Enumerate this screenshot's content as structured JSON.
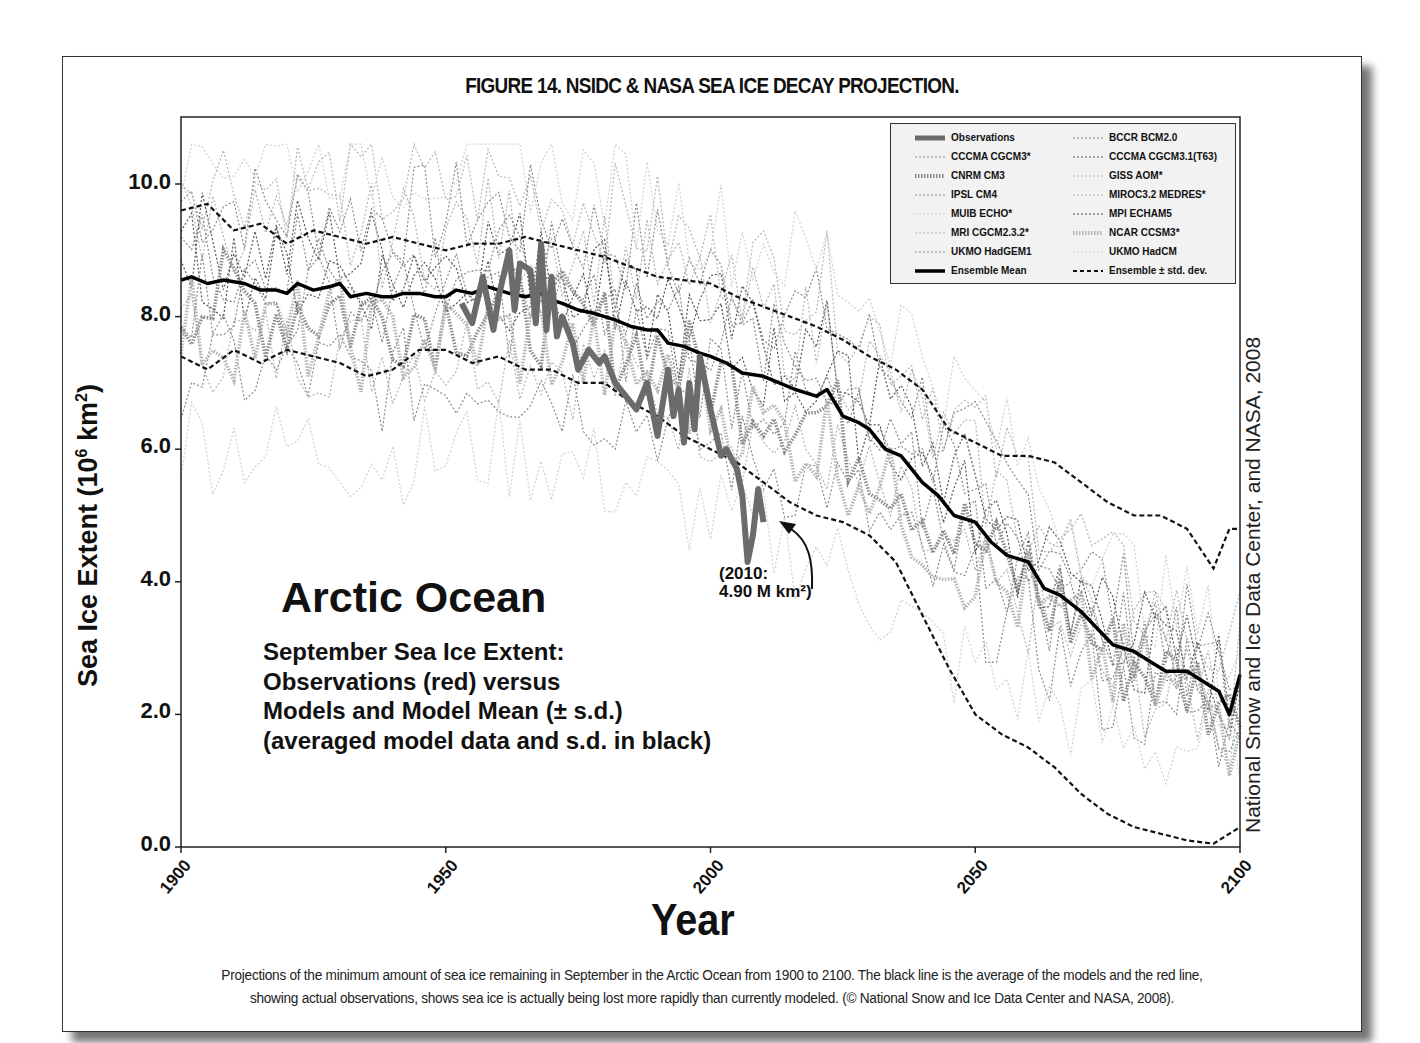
{
  "figure": {
    "title": "FIGURE 14. NSIDC & NASA SEA ICE DECAY PROJECTION.",
    "caption_line1": "Projections of the minimum amount of sea ice remaining in September in the Arctic Ocean from 1900 to 2100.  The black line is the average of the models and the red line,",
    "caption_line2": "showing actual observations, shows sea ice is actually being lost more rapidly than currently modeled. (© National Snow and Ice Data Center and NASA, 2008).",
    "credit_vertical": "National Snow and Ice Data Center, and NASA, 2008"
  },
  "annotations": {
    "region_title": "Arctic Ocean",
    "subtitle_lines": [
      "September Sea Ice Extent:",
      "Observations (red) versus",
      "Models and Model Mean (± s.d.)",
      "(averaged model data and s.d. in black)"
    ],
    "callout_line1": "(2010:",
    "callout_line2": "4.90 M km²)"
  },
  "legend": {
    "items": [
      {
        "label": "Observations",
        "style": "obs"
      },
      {
        "label": "BCCR BCM2.0",
        "style": "dot-mid"
      },
      {
        "label": "CCCMA CGCM3*",
        "style": "dot-mid"
      },
      {
        "label": "CCCMA CGCM3.1(T63)",
        "style": "dot-dark"
      },
      {
        "label": "CNRM CM3",
        "style": "thick-dot"
      },
      {
        "label": "GISS AOM*",
        "style": "dot-light"
      },
      {
        "label": "IPSL CM4",
        "style": "dot-mid"
      },
      {
        "label": "MIROC3.2 MEDRES*",
        "style": "dot-light"
      },
      {
        "label": "MUIB ECHO*",
        "style": "dot-faint"
      },
      {
        "label": "MPI ECHAM5",
        "style": "dot-dark"
      },
      {
        "label": "MRI CGCM2.3.2*",
        "style": "dot-light"
      },
      {
        "label": "NCAR CCSM3*",
        "style": "thick-dot-light"
      },
      {
        "label": "UKMO HadGEM1",
        "style": "dot-mid"
      },
      {
        "label": "UKMO HadCM",
        "style": "dot-faint"
      },
      {
        "label": "Ensemble Mean",
        "style": "mean"
      },
      {
        "label": "Ensemble ± std. dev.",
        "style": "sd"
      }
    ]
  },
  "colors": {
    "observations": "#6b6b6b",
    "ensemble_mean": "#000000",
    "ensemble_sd": "#111111",
    "model_dark": "#555555",
    "model_mid": "#8a8a8a",
    "model_light": "#b5b5b5",
    "model_faint": "#d0d0d0",
    "background": "#ffffff",
    "legend_bg": "#f2f2f2"
  },
  "chart_data": {
    "type": "line",
    "title": "FIGURE 14. NSIDC & NASA SEA ICE DECAY PROJECTION.",
    "xlabel": "Year",
    "ylabel": "Sea Ice Extent (10⁶ km²)",
    "xlim": [
      1900,
      2100
    ],
    "ylim": [
      0,
      11
    ],
    "x_ticks": [
      1900,
      1950,
      2000,
      2050,
      2100
    ],
    "x_tick_labels": [
      "1900",
      "1950",
      "2000",
      "2050",
      "2100"
    ],
    "y_ticks": [
      0,
      2,
      4,
      6,
      8,
      10
    ],
    "y_tick_labels": [
      "0.0",
      "2.0",
      "4.0",
      "6.0",
      "8.0",
      "10.0"
    ],
    "grid": false,
    "legend_position": "upper right",
    "series": [
      {
        "name": "Ensemble Mean",
        "x": [
          1900,
          1902,
          1905,
          1908,
          1912,
          1915,
          1918,
          1920,
          1922,
          1925,
          1928,
          1930,
          1932,
          1935,
          1938,
          1940,
          1942,
          1945,
          1948,
          1950,
          1952,
          1955,
          1958,
          1960,
          1962,
          1965,
          1968,
          1970,
          1972,
          1975,
          1978,
          1980,
          1982,
          1985,
          1988,
          1990,
          1992,
          1995,
          1998,
          2000,
          2003,
          2006,
          2010,
          2013,
          2016,
          2020,
          2022,
          2025,
          2028,
          2030,
          2033,
          2036,
          2040,
          2043,
          2046,
          2050,
          2053,
          2056,
          2060,
          2063,
          2066,
          2070,
          2073,
          2076,
          2080,
          2083,
          2086,
          2090,
          2093,
          2096,
          2098,
          2100
        ],
        "values": [
          8.55,
          8.6,
          8.5,
          8.55,
          8.5,
          8.4,
          8.4,
          8.35,
          8.5,
          8.4,
          8.45,
          8.5,
          8.3,
          8.35,
          8.3,
          8.3,
          8.35,
          8.35,
          8.3,
          8.3,
          8.4,
          8.35,
          8.45,
          8.4,
          8.35,
          8.3,
          8.35,
          8.25,
          8.2,
          8.1,
          8.05,
          8.0,
          7.95,
          7.85,
          7.8,
          7.8,
          7.6,
          7.55,
          7.45,
          7.4,
          7.3,
          7.15,
          7.1,
          7.0,
          6.9,
          6.8,
          6.9,
          6.5,
          6.4,
          6.3,
          6.0,
          5.9,
          5.5,
          5.3,
          5.0,
          4.9,
          4.6,
          4.4,
          4.3,
          3.9,
          3.8,
          3.55,
          3.3,
          3.05,
          2.95,
          2.8,
          2.65,
          2.65,
          2.5,
          2.35,
          2.0,
          2.6
        ]
      },
      {
        "name": "Ensemble + std. dev.",
        "x": [
          1900,
          1905,
          1910,
          1915,
          1920,
          1925,
          1930,
          1935,
          1940,
          1945,
          1950,
          1955,
          1960,
          1965,
          1970,
          1975,
          1980,
          1985,
          1990,
          1995,
          2000,
          2005,
          2010,
          2015,
          2020,
          2025,
          2030,
          2035,
          2040,
          2045,
          2050,
          2055,
          2060,
          2065,
          2070,
          2075,
          2080,
          2085,
          2090,
          2095,
          2098,
          2100
        ],
        "values": [
          9.6,
          9.7,
          9.3,
          9.4,
          9.1,
          9.3,
          9.2,
          9.1,
          9.2,
          9.1,
          9.0,
          9.1,
          9.1,
          9.2,
          9.1,
          9.0,
          8.9,
          8.75,
          8.6,
          8.55,
          8.5,
          8.3,
          8.15,
          8.0,
          7.85,
          7.65,
          7.4,
          7.2,
          6.9,
          6.3,
          6.1,
          5.9,
          5.9,
          5.8,
          5.5,
          5.2,
          5.0,
          5.0,
          4.8,
          4.2,
          4.8,
          4.8
        ]
      },
      {
        "name": "Ensemble − std. dev.",
        "x": [
          1900,
          1905,
          1910,
          1915,
          1920,
          1925,
          1930,
          1935,
          1940,
          1945,
          1950,
          1955,
          1960,
          1965,
          1970,
          1975,
          1980,
          1985,
          1990,
          1995,
          2000,
          2005,
          2010,
          2015,
          2020,
          2025,
          2030,
          2035,
          2040,
          2045,
          2050,
          2055,
          2060,
          2065,
          2070,
          2075,
          2080,
          2085,
          2090,
          2095,
          2100
        ],
        "values": [
          7.4,
          7.2,
          7.5,
          7.3,
          7.5,
          7.4,
          7.3,
          7.1,
          7.2,
          7.5,
          7.5,
          7.3,
          7.4,
          7.2,
          7.2,
          7.0,
          7.0,
          6.7,
          6.5,
          6.2,
          6.0,
          5.8,
          5.5,
          5.2,
          5.0,
          4.9,
          4.7,
          4.3,
          3.5,
          2.7,
          2.0,
          1.7,
          1.5,
          1.2,
          0.8,
          0.5,
          0.3,
          0.2,
          0.1,
          0.05,
          0.3
        ]
      },
      {
        "name": "Observations",
        "x": [
          1953,
          1955,
          1957,
          1959,
          1960,
          1962,
          1963,
          1964,
          1966,
          1967,
          1968,
          1969,
          1970,
          1971,
          1972,
          1974,
          1975,
          1977,
          1979,
          1980,
          1982,
          1984,
          1986,
          1988,
          1989,
          1990,
          1992,
          1993,
          1994,
          1995,
          1996,
          1997,
          1998,
          2000,
          2002,
          2003,
          2005,
          2006,
          2007,
          2008,
          2009,
          2010
        ],
        "values": [
          8.2,
          7.9,
          8.6,
          7.8,
          8.3,
          9.0,
          8.1,
          8.8,
          8.7,
          7.9,
          9.1,
          7.8,
          8.6,
          7.7,
          8.0,
          7.6,
          7.2,
          7.5,
          7.3,
          7.4,
          7.0,
          6.8,
          6.6,
          7.0,
          6.6,
          6.2,
          7.2,
          6.5,
          6.9,
          6.1,
          7.0,
          6.3,
          7.4,
          6.6,
          5.9,
          6.0,
          5.7,
          5.3,
          4.3,
          4.7,
          5.4,
          4.9
        ]
      }
    ]
  }
}
